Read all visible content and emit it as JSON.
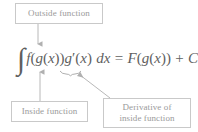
{
  "figure": {
    "background_color": "#ffffff",
    "text_color": "#9a9a9a",
    "equation_color": "#5f5f5f",
    "box_border_color": "#c9c9c9",
    "arrow_color": "#b0b0b0"
  },
  "callouts": {
    "outside": {
      "label": "Outside function",
      "points_to": "f"
    },
    "inside": {
      "label": "Inside function",
      "points_to": "g(x)"
    },
    "derivative": {
      "line1": "Derivative of",
      "line2": "inside function",
      "points_to": "g'(x)"
    }
  },
  "equation": {
    "integral_sign": "∫",
    "f": "f",
    "open1": "(",
    "g1": "g",
    "open2": "(",
    "x1": "x",
    "close2": ")",
    "close1": ")",
    "g2": "g",
    "prime": "′",
    "open3": "(",
    "x2": "x",
    "close3": ")",
    "dx": "dx",
    "equals": "=",
    "F": "F",
    "open4": "(",
    "g3": "g",
    "open5": "(",
    "x3": "x",
    "close5": ")",
    "close4": ")",
    "plus": "+",
    "C": "C",
    "plain_text": "∫f(g(x))g′(x) dx = F(g(x)) + C"
  },
  "annotations": {
    "underbrace_label": "underbrace-under-g-prime-x",
    "arrow_outside_label": "arrow-down-to-f",
    "arrow_inside_label": "arrow-up-to-g-of-x",
    "arrow_derivative_label": "arrow-diagonal-to-g-prime"
  }
}
